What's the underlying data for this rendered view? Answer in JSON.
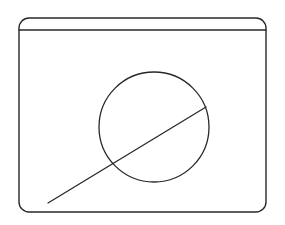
{
  "document": {
    "kind": "wireframe-sketch",
    "background_color": "#ffffff",
    "stroke_color": "#282828",
    "width": 285,
    "height": 225,
    "title_text": "",
    "has_visible_text": false
  },
  "window": {
    "name": "window-frame",
    "x": 19,
    "y": 18,
    "width": 247,
    "height": 194,
    "corner_radius": 10,
    "stroke_width": 1.4,
    "fill": "#ffffff"
  },
  "titlebar": {
    "name": "window-titlebar",
    "label": "",
    "height": 12,
    "divider_y": 30,
    "divider_x_start": 19,
    "divider_x_end": 266,
    "stroke_width": 1.4,
    "controls": []
  },
  "canvas": {
    "name": "window-content-area",
    "x": 19,
    "y": 30,
    "width": 247,
    "height": 182
  },
  "shapes": [
    {
      "name": "circle-shape",
      "type": "circle",
      "center_x": 154,
      "center_y": 127,
      "radius": 55,
      "stroke_width": 1.3,
      "fill": "none"
    },
    {
      "name": "diagonal-line-shape",
      "type": "line",
      "x1": 48,
      "y1": 203,
      "x2": 206,
      "y2": 107,
      "stroke_width": 1.3
    }
  ]
}
